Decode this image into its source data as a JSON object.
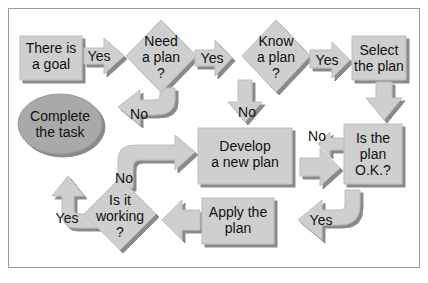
{
  "diagram": {
    "type": "flowchart",
    "colors": {
      "shape_fill": "#cfcfcf",
      "shadow": "#8a8a8a",
      "oval_fill": "#a9a9a9",
      "text": "#111111",
      "border": "#9a9a9a"
    },
    "nodes": {
      "goal": {
        "line1": "There is",
        "line2": "a goal"
      },
      "need": {
        "line1": "Need",
        "line2": "a plan",
        "line3": "?"
      },
      "know": {
        "line1": "Know",
        "line2": "a plan",
        "line3": "?"
      },
      "select": {
        "line1": "Select",
        "line2": "the plan"
      },
      "complete": {
        "line1": "Complete",
        "line2": "the task"
      },
      "develop": {
        "line1": "Develop",
        "line2": "a new plan"
      },
      "isok": {
        "line1": "Is the",
        "line2": "plan",
        "line3": "O.K.?"
      },
      "working": {
        "line1": "Is it",
        "line2": "working",
        "line3": "?"
      },
      "apply": {
        "line1": "Apply the",
        "line2": "plan"
      }
    },
    "edges": {
      "goal_need": "Yes",
      "need_know": "Yes",
      "know_select": "Yes",
      "need_complete": "No",
      "know_develop": "No",
      "isok_develop": "No",
      "working_develop": "No",
      "isok_apply": "Yes",
      "working_complete": "Yes"
    }
  }
}
